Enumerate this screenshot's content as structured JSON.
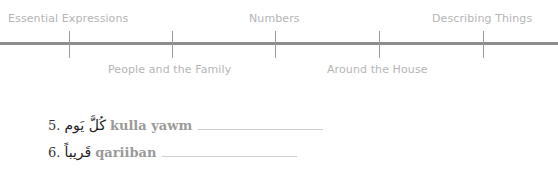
{
  "timeline": {
    "top_labels": [
      {
        "text": "Essential Expressions",
        "x": 8
      },
      {
        "text": "Numbers",
        "x": 249
      },
      {
        "text": "Describing Things",
        "x": 432
      }
    ],
    "bottom_labels": [
      {
        "text": "People and the Family",
        "x": 108
      },
      {
        "text": "Around the House",
        "x": 327
      }
    ],
    "ticks_x": [
      69,
      172,
      275,
      379,
      483
    ]
  },
  "exercises": [
    {
      "number": "5.",
      "arabic": "كُلَّ يَوم",
      "transliteration": "kulla yawm"
    },
    {
      "number": "6.",
      "arabic": "قَريباً",
      "transliteration": "qariiban"
    }
  ]
}
